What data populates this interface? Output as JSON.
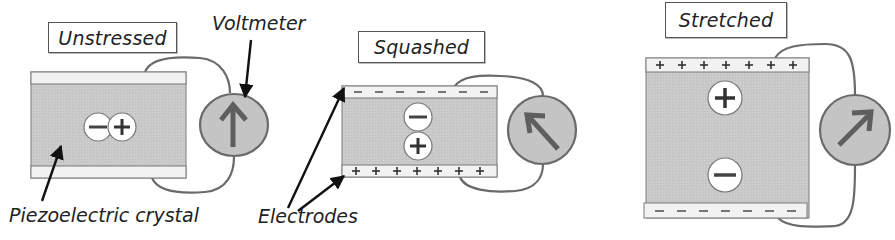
{
  "figure": {
    "colors": {
      "crystal": "#c9c9c9",
      "electrode": "#f2f2f2",
      "outline": "#6a6a6a",
      "wire": "#6a6a6a",
      "meter_fill": "#bdbdbd",
      "needle": "#5e5e5e",
      "arrow": "#111111"
    }
  },
  "panels": [
    {
      "id": "unstressed",
      "title": "Unstressed",
      "top_electrode_charge": "none",
      "bottom_electrode_charge": "none",
      "internal_charges": [
        "−",
        "+"
      ],
      "internal_charge_layout": "horizontal",
      "meter_needle": "up"
    },
    {
      "id": "squashed",
      "title": "Squashed",
      "top_electrode_charge": "−",
      "bottom_electrode_charge": "+",
      "top_electrode_symbols": [
        "−",
        "−",
        "−",
        "−",
        "−",
        "−",
        "−"
      ],
      "bottom_electrode_symbols": [
        "+",
        "+",
        "+",
        "+",
        "+",
        "+",
        "+"
      ],
      "internal_charges": [
        "−",
        "+"
      ],
      "internal_charge_layout": "vertical",
      "meter_needle": "up-left"
    },
    {
      "id": "stretched",
      "title": "Stretched",
      "top_electrode_charge": "+",
      "bottom_electrode_charge": "−",
      "top_electrode_symbols": [
        "+",
        "+",
        "+",
        "+",
        "+",
        "+",
        "+"
      ],
      "bottom_electrode_symbols": [
        "−",
        "−",
        "−",
        "−",
        "−",
        "−",
        "−"
      ],
      "internal_charges": [
        "+",
        "−"
      ],
      "internal_charge_layout": "vertical",
      "meter_needle": "up-right"
    }
  ],
  "callouts": {
    "voltmeter": "Voltmeter",
    "crystal": "Piezoelectric crystal",
    "electrodes": "Electrodes"
  },
  "symbols": {
    "plus": "+",
    "minus": "−"
  }
}
